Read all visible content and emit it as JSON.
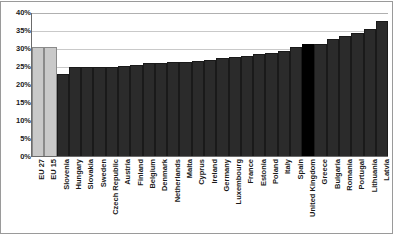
{
  "chart_data": {
    "type": "bar",
    "title": "",
    "subtitle": "",
    "xlabel": "",
    "ylabel": "",
    "ylim": [
      0,
      40
    ],
    "ytick_labels": [
      "40%",
      "35%",
      "30%",
      "25%",
      "20%",
      "15%",
      "10%",
      "5%",
      "0%"
    ],
    "ytick_values": [
      40,
      35,
      30,
      25,
      20,
      15,
      10,
      5,
      0
    ],
    "grid": true,
    "legend": "none",
    "categories": [
      "EU 27",
      "EU 15",
      "Slovenia",
      "Hungary",
      "Slovakia",
      "Sweden",
      "Czech Republic",
      "Austria",
      "Finland",
      "Belgium",
      "Denmark",
      "Netherlands",
      "Malta",
      "Cyprus",
      "Ireland",
      "Germany",
      "Luxembourg",
      "France",
      "Estonia",
      "Poland",
      "Italy",
      "Spain",
      "United Kingdom",
      "Greece",
      "Bulgaria",
      "Romania",
      "Portugal",
      "Lithuania",
      "Latvia"
    ],
    "values": [
      30.2,
      30.2,
      22.8,
      24.6,
      24.6,
      24.6,
      24.8,
      25.0,
      25.4,
      25.8,
      25.9,
      26.1,
      26.1,
      26.4,
      26.8,
      27.2,
      27.4,
      27.8,
      28.2,
      28.6,
      29.3,
      30.2,
      31.0,
      31.2,
      32.6,
      33.2,
      34.2,
      35.3,
      37.4
    ],
    "bar_styles": [
      "light",
      "light",
      "dark",
      "dark",
      "dark",
      "dark",
      "dark",
      "dark",
      "dark",
      "dark",
      "dark",
      "dark",
      "dark",
      "dark",
      "dark",
      "dark",
      "dark",
      "dark",
      "dark",
      "dark",
      "dark",
      "dark",
      "black",
      "dark",
      "dark",
      "dark",
      "dark",
      "dark",
      "dark"
    ],
    "colors": {
      "light_bar": "#c9c9c9",
      "dark_bar": "#2b2b2b",
      "highlight_bar": "#000000",
      "gridline": "#c9c9c9",
      "axis": "#6b6b6b",
      "frame": "#9a9a9a",
      "background": "#ffffff",
      "text": "#1a1a1a"
    }
  }
}
